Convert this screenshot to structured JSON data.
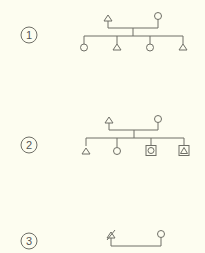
{
  "diagrams": [
    {
      "label": "1",
      "parents": [
        "male",
        "female"
      ],
      "children": [
        "female",
        "male",
        "female",
        "male"
      ]
    },
    {
      "label": "2",
      "parents": [
        "male",
        "female"
      ],
      "children": [
        "male",
        "female",
        "female-boxed",
        "male-boxed"
      ]
    },
    {
      "label": "3",
      "parents": [
        "male-deceased",
        "female"
      ],
      "children": []
    }
  ],
  "colors": {
    "background": "#fdfdf0",
    "line": "#6e6e66"
  }
}
